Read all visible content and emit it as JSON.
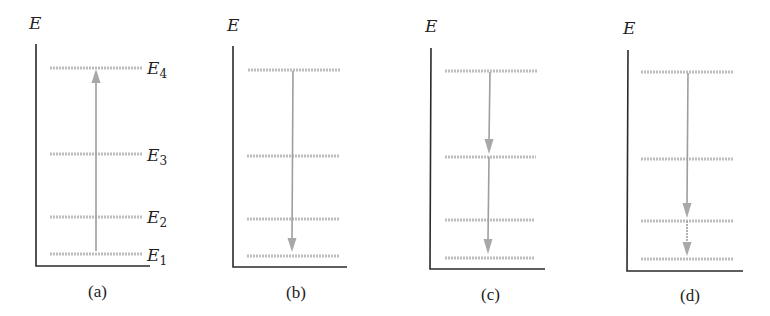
{
  "figure": {
    "axis_label": "E",
    "level_labels": [
      {
        "base": "E",
        "sub": "4"
      },
      {
        "base": "E",
        "sub": "3"
      },
      {
        "base": "E",
        "sub": "2"
      },
      {
        "base": "E",
        "sub": "1"
      }
    ],
    "panels": [
      {
        "id": "a",
        "caption": "(a)",
        "description": "Absorption: upward transition E1 to E4",
        "transitions": [
          {
            "from": "E1",
            "to": "E4",
            "direction": "up"
          }
        ]
      },
      {
        "id": "b",
        "caption": "(b)",
        "description": "Emission: direct downward transition E4 to E1",
        "transitions": [
          {
            "from": "E4",
            "to": "E1",
            "direction": "down"
          }
        ]
      },
      {
        "id": "c",
        "caption": "(c)",
        "description": "Cascade emission: E4 to E3, then E3 to E1",
        "transitions": [
          {
            "from": "E4",
            "to": "E3",
            "direction": "down"
          },
          {
            "from": "E3",
            "to": "E1",
            "direction": "down"
          }
        ]
      },
      {
        "id": "d",
        "caption": "(d)",
        "description": "Cascade emission: E4 to E2, then E2 to E1",
        "transitions": [
          {
            "from": "E4",
            "to": "E2",
            "direction": "down"
          },
          {
            "from": "E2",
            "to": "E1",
            "direction": "down"
          }
        ]
      }
    ],
    "colors": {
      "axis": "#2a2a2a",
      "level": "#bdbdbd",
      "arrow": "#9e9e9e",
      "text": "#222222"
    }
  }
}
